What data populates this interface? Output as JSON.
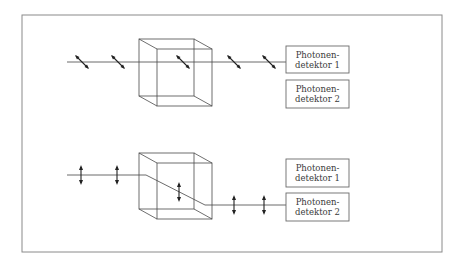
{
  "diagram": {
    "panels": [
      {
        "name": "top",
        "polarization": "diagonal",
        "detectors": [
          {
            "line1": "Photonen-",
            "line2": "detektor 1"
          },
          {
            "line1": "Photonen-",
            "line2": "detektor 2"
          }
        ],
        "beam_to": "detektor 1"
      },
      {
        "name": "bottom",
        "polarization": "vertical",
        "detectors": [
          {
            "line1": "Photonen-",
            "line2": "detektor 1"
          },
          {
            "line1": "Photonen-",
            "line2": "detektor 2"
          }
        ],
        "beam_to": "detektor 2"
      }
    ]
  }
}
